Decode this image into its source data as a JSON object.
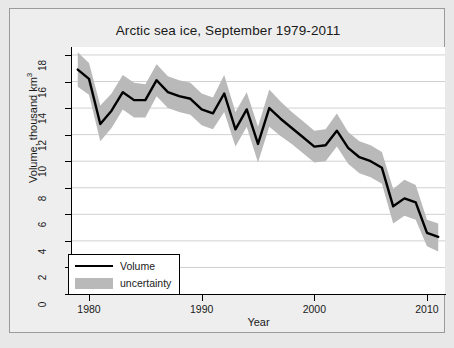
{
  "figure": {
    "background_color": "#e8e8e8",
    "panel_color": "#eeeeee",
    "plot_color": "#ffffff"
  },
  "chart_data": {
    "type": "line",
    "title": "Arctic sea ice, September 1979-2011",
    "xlabel": "Year",
    "ylabel": "Volume, thousand km",
    "ylabel_superscript": "3",
    "xlim": [
      1978.4,
      1911.0
    ],
    "x_axis_range": [
      1978.4,
      2011.6
    ],
    "ylim": [
      0,
      18.6
    ],
    "xticks": [
      1980,
      1990,
      2000,
      2010
    ],
    "yticks": [
      0,
      2,
      4,
      6,
      8,
      10,
      12,
      14,
      16,
      18
    ],
    "grid": "horizontal",
    "grid_color": "#d0d0d0",
    "legend_position": "bottom-left",
    "line_color": "#000000",
    "band_color": "#b9b9b9",
    "series": [
      {
        "name": "Volume",
        "type": "line",
        "x": [
          1979,
          1980,
          1981,
          1982,
          1983,
          1984,
          1985,
          1986,
          1987,
          1988,
          1989,
          1990,
          1991,
          1992,
          1993,
          1994,
          1995,
          1996,
          1997,
          1998,
          1999,
          2000,
          2001,
          2002,
          2003,
          2004,
          2005,
          2006,
          2007,
          2008,
          2009,
          2010,
          2011
        ],
        "values": [
          16.9,
          16.2,
          12.8,
          13.8,
          15.2,
          14.6,
          14.6,
          16.1,
          15.2,
          14.9,
          14.7,
          13.9,
          13.6,
          15.1,
          12.4,
          13.9,
          11.3,
          14.0,
          13.2,
          12.5,
          11.8,
          11.1,
          11.2,
          12.3,
          11.0,
          10.3,
          10.0,
          9.5,
          6.6,
          7.2,
          6.9,
          4.6,
          4.3
        ]
      },
      {
        "name": "uncertainty",
        "type": "band",
        "x": [
          1979,
          1980,
          1981,
          1982,
          1983,
          1984,
          1985,
          1986,
          1987,
          1988,
          1989,
          1990,
          1991,
          1992,
          1993,
          1994,
          1995,
          1996,
          1997,
          1998,
          1999,
          2000,
          2001,
          2002,
          2003,
          2004,
          2005,
          2006,
          2007,
          2008,
          2009,
          2010,
          2011
        ],
        "upper": [
          18.2,
          17.4,
          14.2,
          15.1,
          16.5,
          15.9,
          15.8,
          17.3,
          16.4,
          16.1,
          15.9,
          15.1,
          14.8,
          16.5,
          13.7,
          15.2,
          12.6,
          15.4,
          14.5,
          13.7,
          13.0,
          12.3,
          12.4,
          13.6,
          12.2,
          11.5,
          11.2,
          10.7,
          7.9,
          8.6,
          8.2,
          5.6,
          5.3
        ],
        "lower": [
          15.6,
          15.0,
          11.5,
          12.5,
          13.9,
          13.3,
          13.3,
          14.9,
          14.0,
          13.7,
          13.5,
          12.7,
          12.4,
          13.7,
          11.1,
          12.6,
          9.9,
          12.6,
          11.9,
          11.3,
          10.6,
          9.9,
          10.0,
          11.1,
          9.8,
          9.1,
          8.8,
          8.3,
          5.3,
          5.9,
          5.6,
          3.6,
          3.2
        ]
      }
    ]
  },
  "axes": {
    "y_tick_labels": [
      "0",
      "2",
      "4",
      "6",
      "8",
      "10",
      "12",
      "14",
      "16",
      "18"
    ],
    "x_tick_labels": [
      "1980",
      "1990",
      "2000",
      "2010"
    ]
  },
  "legend": {
    "items": [
      {
        "label": "Volume",
        "swatch": "line",
        "color": "#000000"
      },
      {
        "label": "uncertainty",
        "swatch": "band",
        "color": "#b9b9b9"
      }
    ]
  }
}
